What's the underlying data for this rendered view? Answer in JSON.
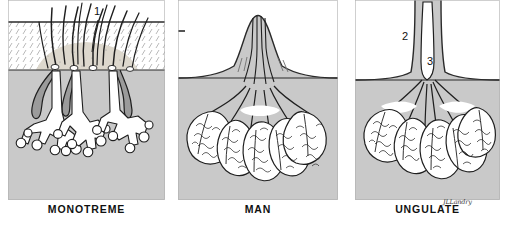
{
  "figure": {
    "title_visible": false,
    "background_color": "#ffffff",
    "panel_fill_color": "#c9c9c9",
    "tissue_fill_color": "#ffffff",
    "ink_color": "#1a1a1a",
    "skin_fill_color": "#d6d2c8"
  },
  "panels": [
    {
      "id": "monotreme",
      "caption": "MONOTREME",
      "x": 8,
      "width": 157,
      "description_visible": false,
      "features": {
        "has_hair": true,
        "hair_count": 12,
        "gland_type": "branched tubular glands opening at hair follicles",
        "gland_clusters": 3,
        "has_nipple": false,
        "skin_surface_line": true
      }
    },
    {
      "id": "man",
      "caption": "MAN",
      "x": 178,
      "width": 160,
      "description_visible": false,
      "features": {
        "has_hair": false,
        "gland_type": "lobulo-alveolar glands with converging lactiferous ducts",
        "lobule_count": 7,
        "has_nipple": true,
        "duct_count": 5,
        "skin_surface_line": true
      }
    },
    {
      "id": "ungulate",
      "caption": "UNGULATE",
      "x": 355,
      "width": 145,
      "description_visible": false,
      "features": {
        "has_hair": false,
        "gland_type": "lobulo-alveolar glands draining into a teat cistern",
        "lobule_count": 6,
        "has_nipple": true,
        "has_cistern": true,
        "skin_surface_line": true
      }
    }
  ],
  "callouts": [
    {
      "label": "1",
      "panel": "monotreme",
      "x": 97,
      "y": 13,
      "refers_to": "hair shaft / follicle opening",
      "has_leader_line": true
    },
    {
      "label": "2",
      "panel": "ungulate",
      "x": 405,
      "y": 37,
      "refers_to": "teat wall",
      "has_leader_line": false
    },
    {
      "label": "3",
      "panel": "ungulate",
      "x": 430,
      "y": 62,
      "refers_to": "teat cistern",
      "has_leader_line": false
    }
  ],
  "signature": {
    "text": "JLLandry"
  }
}
